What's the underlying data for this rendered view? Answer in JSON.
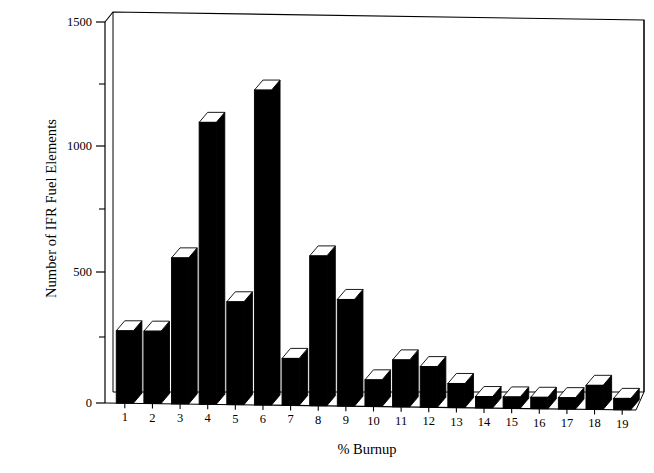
{
  "chart_data": {
    "type": "bar",
    "title": "",
    "subtitle": "",
    "xlabel": "% Burnup",
    "ylabel": "Number of IFR Fuel Elements",
    "categories": [
      "1",
      "2",
      "3",
      "4",
      "5",
      "6",
      "7",
      "8",
      "9",
      "10",
      "11",
      "12",
      "13",
      "14",
      "15",
      "16",
      "17",
      "18",
      "19"
    ],
    "values": [
      285,
      285,
      575,
      1110,
      405,
      1240,
      185,
      590,
      420,
      105,
      185,
      160,
      95,
      45,
      45,
      45,
      45,
      95,
      45
    ],
    "series": [
      {
        "name": "Number of IFR Fuel Elements",
        "values": [
          285,
          285,
          575,
          1110,
          405,
          1240,
          185,
          590,
          420,
          105,
          185,
          160,
          95,
          45,
          45,
          45,
          45,
          95,
          45
        ]
      }
    ],
    "ylim": [
      0,
      1500
    ],
    "y_major_ticks": [
      0,
      500,
      1000,
      1500
    ],
    "y_minor_ticks": [
      250,
      750,
      1250
    ],
    "y_tick_labels": [
      "0",
      "500",
      "1000",
      "1500"
    ],
    "grid": false,
    "legend": "none",
    "style": "3d-bar",
    "bar_color": "#000000",
    "bar_top_color": "#ffffff",
    "frame_color": "#000000",
    "background_color": "#ffffff",
    "annotations": []
  },
  "axes": {
    "y_title": "Number of IFR Fuel Elements",
    "x_title": "% Burnup",
    "y_labels": [
      "1500",
      "1000",
      "500",
      "0"
    ],
    "x_labels": [
      "1",
      "2",
      "3",
      "4",
      "5",
      "6",
      "7",
      "8",
      "9",
      "10",
      "11",
      "12",
      "13",
      "14",
      "15",
      "16",
      "17",
      "18",
      "19"
    ]
  }
}
